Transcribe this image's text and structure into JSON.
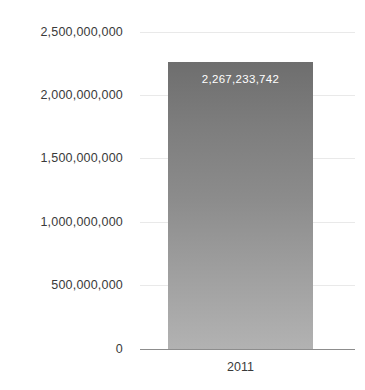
{
  "chart_data": {
    "type": "bar",
    "title": "",
    "subtitle": "",
    "xlabel": "",
    "ylabel": "",
    "categories": [
      "2011"
    ],
    "values": [
      2267233742
    ],
    "value_labels": [
      "2,267,233,742"
    ],
    "ylim": [
      0,
      2500000000
    ],
    "y_ticks": [
      0,
      500000000,
      1000000000,
      1500000000,
      2000000000,
      2500000000
    ],
    "y_tick_labels": [
      "0",
      "500,000,000",
      "1,000,000,000",
      "1,500,000,000",
      "2,000,000,000",
      "2,500,000,000"
    ],
    "grid": true,
    "legend": false,
    "legend_position": "none",
    "series": [
      {
        "name": "",
        "values": [
          2267233742
        ]
      }
    ],
    "colors": {
      "bar_top": "#6e6e6e",
      "bar_bottom": "#b2b2b2",
      "gridline": "#e9e9e9",
      "axis_line": "#8d8d8d",
      "tick_text": "#3a3a3a",
      "value_label_text": "#ffffff",
      "background": "#ffffff"
    }
  },
  "axis": {
    "y_labels": [
      {
        "text": "2,500,000,000",
        "top": 26
      },
      {
        "text": "2,000,000,000",
        "top": 89
      },
      {
        "text": "1,500,000,000",
        "top": 152
      },
      {
        "text": "1,000,000,000",
        "top": 216
      },
      {
        "text": "500,000,000",
        "top": 279
      },
      {
        "text": "0",
        "top": 343
      }
    ],
    "x_labels": [
      {
        "text": "2011"
      }
    ]
  },
  "bar": {
    "value_label": "2,267,233,742"
  }
}
